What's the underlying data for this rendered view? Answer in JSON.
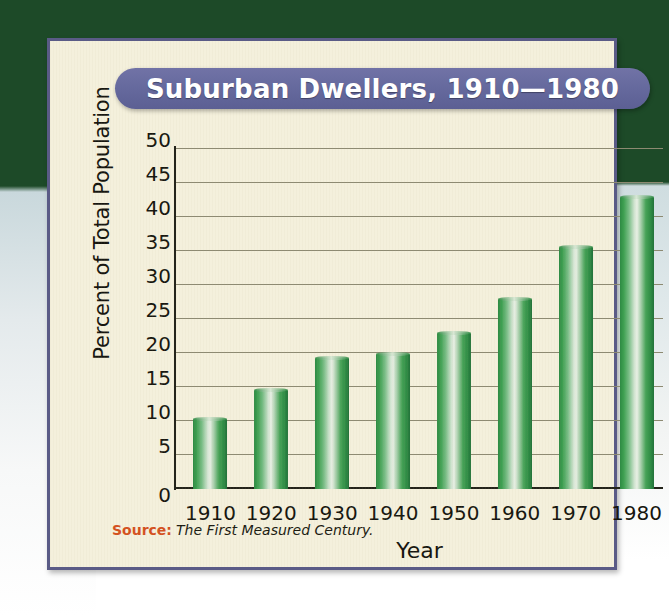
{
  "title": "Suburban Dwellers, 1910—1980",
  "source": {
    "label": "Source:",
    "text": "The First Measured Century."
  },
  "colors": {
    "title_pill": "#666a9e",
    "frame_border": "#5a5b86",
    "card_background": "#f4f0dc",
    "bar_green": "#2d8a43",
    "bar_highlight": "#e8efe4",
    "gridline": "#8d8a72",
    "axis": "#23231a",
    "source_label": "#d4511e",
    "page_top": "#1d4a28"
  },
  "chart_data": {
    "type": "bar",
    "title": "Suburban Dwellers, 1910—1980",
    "xlabel": "Year",
    "ylabel": "Percent of Total Population",
    "categories": [
      "1910",
      "1920",
      "1930",
      "1940",
      "1950",
      "1960",
      "1970",
      "1980"
    ],
    "values": [
      10.3,
      14.6,
      19.2,
      19.8,
      23.0,
      28.0,
      35.6,
      43.0
    ],
    "ylim": [
      0,
      50
    ],
    "yticks": [
      0,
      5,
      10,
      15,
      20,
      25,
      30,
      35,
      40,
      45,
      50
    ],
    "ytick_labels": [
      "0",
      "5",
      "10",
      "15",
      "20",
      "25",
      "30",
      "35",
      "40",
      "45",
      "50"
    ],
    "grid": true,
    "legend": false
  }
}
